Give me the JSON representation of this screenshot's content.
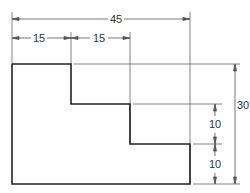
{
  "drawing": {
    "type": "stepped-profile-dimensioned",
    "dimensions": {
      "overall_width": "45",
      "step1_width": "15",
      "step2_width": "15",
      "overall_height": "30",
      "step_height_upper": "10",
      "step_height_lower": "10"
    },
    "colors": {
      "outline": "#222222",
      "dimension_line": "#555555",
      "text": "#333333",
      "background": "#ffffff"
    }
  }
}
